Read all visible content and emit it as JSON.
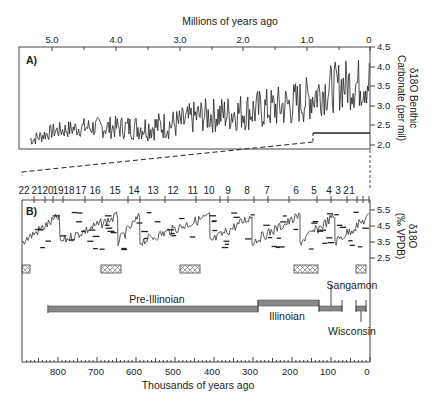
{
  "chart_data": [
    {
      "panel": "A)",
      "type": "line",
      "title": "",
      "xlabel": "Millions of years ago",
      "ylabel_line1": "δ18O Benthic",
      "ylabel_line2": "Carbonate (per mil)",
      "x_ticks": [
        "5.0",
        "4.0",
        "3.0",
        "2.0",
        "1.0",
        "0"
      ],
      "y_ticks": [
        "4.5",
        "4.0",
        "3.5",
        "3.0",
        "2.5",
        "2.0"
      ],
      "xlim": [
        5.5,
        0
      ],
      "ylim": [
        2.0,
        4.5
      ],
      "x_axis_position": "top",
      "y_axis_position": "right",
      "grid": false,
      "series": [
        {
          "name": "δ18O benthic",
          "x": [
            5.3,
            5.0,
            4.5,
            4.0,
            3.5,
            3.0,
            2.7,
            2.5,
            2.0,
            1.5,
            1.2,
            1.0,
            0.8,
            0.6,
            0.4,
            0.2,
            0
          ],
          "y": [
            2.5,
            2.7,
            2.8,
            2.8,
            2.8,
            2.9,
            3.1,
            3.1,
            3.2,
            3.3,
            3.4,
            3.5,
            3.7,
            3.8,
            3.9,
            3.9,
            4.0
          ]
        }
      ],
      "annotation": "Bracket marks 0–0.9 Ma range expanded in panel B"
    },
    {
      "panel": "B)",
      "type": "line",
      "xlabel": "Thousands of years ago",
      "ylabel_line1": "δ18O",
      "ylabel_line2": "(‰ VPDB)",
      "x_ticks": [
        "800",
        "700",
        "600",
        "500",
        "400",
        "300",
        "200",
        "100",
        "0"
      ],
      "y_ticks": [
        "5.5",
        "4.5",
        "3.5",
        "2.5"
      ],
      "xlim": [
        880,
        0
      ],
      "ylim": [
        2.5,
        5.5
      ],
      "marine_isotope_stages": [
        "22",
        "21",
        "20",
        "19",
        "18",
        "17",
        "16",
        "15",
        "14",
        "13",
        "12",
        "11",
        "10",
        "9",
        "8",
        "7",
        "6",
        "5",
        "4",
        "3",
        "2",
        "1"
      ],
      "glaciations": [
        {
          "name": "Pre-Illinoian",
          "start_ka": 820,
          "end_ka": 280
        },
        {
          "name": "Illinoian",
          "start_ka": 280,
          "end_ka": 130
        },
        {
          "name": "Sangamon",
          "start_ka": 130,
          "end_ka": 70
        },
        {
          "name": "Wisconsin",
          "start_ka": 35,
          "end_ka": 10
        }
      ],
      "hatched_boxes_ka": [
        870,
        650,
        440,
        170,
        15
      ]
    }
  ]
}
